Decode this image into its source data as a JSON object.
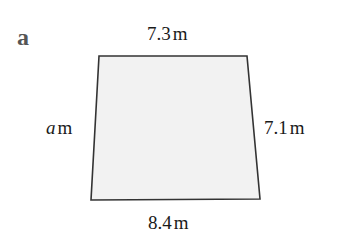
{
  "part_label": "a",
  "shape": {
    "type": "quadrilateral",
    "fill": "#f2f2f2",
    "stroke": "#333333",
    "vertices": {
      "top_left": [
        99,
        56
      ],
      "top_right": [
        247,
        56
      ],
      "bottom_right": [
        260,
        199
      ],
      "bottom_left": [
        91,
        200
      ]
    }
  },
  "sides": {
    "top": {
      "value": "7.3",
      "unit": "m"
    },
    "right": {
      "value": "7.1",
      "unit": "m"
    },
    "bottom": {
      "value": "8.4",
      "unit": "m"
    },
    "left": {
      "variable": "a",
      "unit": "m"
    }
  }
}
